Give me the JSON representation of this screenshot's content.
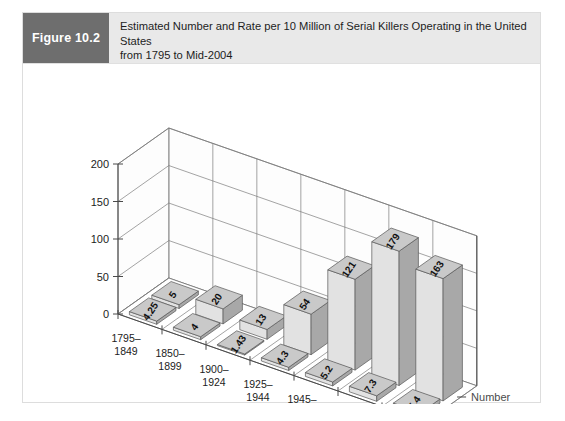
{
  "figure": {
    "label": "Figure 10.2",
    "title_line1": "Estimated Number and Rate per 10 Million of Serial Killers Operating in the United States",
    "title_line2": "from 1795 to Mid-2004"
  },
  "colors": {
    "label_box": "#6e6e6e",
    "header_band": "#e9e9e9",
    "bar_front": "#e2e2e2",
    "bar_side": "#a8a8a8",
    "bar_top": "#c9c9c9",
    "axis": "#4a4a4a",
    "card_border": "#dddddd"
  },
  "chart_data": {
    "type": "bar",
    "title": "Estimated Number and Rate per 10 Million of Serial Killers Operating in the United States from 1795 to Mid-2004",
    "xlabel": "",
    "ylabel": "",
    "ylim": [
      0,
      200
    ],
    "yticks": [
      0,
      50,
      100,
      150,
      200
    ],
    "ytick_labels": [
      "0",
      "50",
      "100",
      "150",
      "200"
    ],
    "grid": true,
    "legend_position": "depth-axis-right",
    "depth_axis_labels": [
      "Number",
      "Rate"
    ],
    "categories": [
      "1795–1849",
      "1850–1899",
      "1900–1924",
      "1925–1944",
      "1945–1979",
      "1980–1989",
      "1990–2004"
    ],
    "category_lines": [
      [
        "1795–",
        "1849"
      ],
      [
        "1850–",
        "1899"
      ],
      [
        "1900–",
        "1924"
      ],
      [
        "1925–",
        "1944"
      ],
      [
        "1945–",
        "1979"
      ],
      [
        "1980–",
        "1989"
      ],
      [
        "1990–",
        "2004"
      ]
    ],
    "series": [
      {
        "name": "Number",
        "values": [
          5,
          20,
          13,
          54,
          121,
          179,
          163
        ],
        "labels": [
          "5",
          "20",
          "13",
          "54",
          "121",
          "179",
          "163"
        ]
      },
      {
        "name": "Rate",
        "values": [
          4.25,
          4,
          1.43,
          4.3,
          5.2,
          7.3,
          5.4
        ],
        "labels": [
          "4.25",
          "4",
          "1.43",
          "4.3",
          "5.2",
          "7.3",
          "5.4"
        ]
      }
    ]
  }
}
